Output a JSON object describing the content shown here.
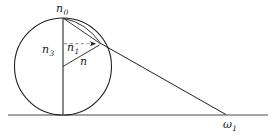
{
  "figure": {
    "background_color": "#ffffff",
    "stroke_color": "#231f20",
    "dashed_color": "#8a8a8a",
    "width": 280,
    "height": 138
  },
  "labels": {
    "apex": {
      "base": "n",
      "sub": "0",
      "name": "label-n0"
    },
    "vertical_radius": {
      "base": "n",
      "sub": "3",
      "name": "label-n3"
    },
    "upper_segment": {
      "base": "n",
      "sub": "1",
      "name": "label-n1"
    },
    "radius": {
      "base": "n",
      "sub": "",
      "name": "label-n"
    },
    "ground_point": {
      "base": "ω",
      "sub": "1",
      "name": "label-omega1"
    }
  },
  "geometry": {
    "circle": {
      "cx": 63,
      "cy": 66.5,
      "r": 48.5
    },
    "baseline": {
      "x1": 8,
      "y1": 115,
      "x2": 268,
      "y2": 115
    },
    "vertical_axis": {
      "x1": 63,
      "y1": 18,
      "x2": 63,
      "y2": 115
    },
    "tangent_point": {
      "x": 101,
      "y": 44
    },
    "ground_contact": {
      "x": 226,
      "y": 115
    },
    "dashed_arrow": {
      "x1": 64,
      "y1": 43.5,
      "x2": 99,
      "y2": 43.8
    },
    "radius_line": {
      "x1": 63,
      "y1": 66.5,
      "x2": 100,
      "y2": 44.5
    },
    "chord_from_apex": {
      "x1": 63,
      "y1": 18,
      "x2": 101,
      "y2": 44
    },
    "long_line": {
      "x1": 101,
      "y1": 44,
      "x2": 226,
      "y2": 115
    }
  }
}
